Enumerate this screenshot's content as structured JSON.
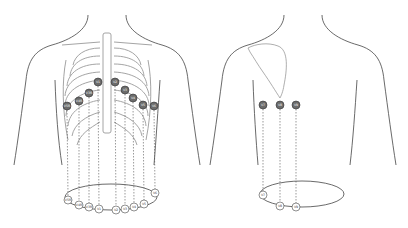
{
  "colors": {
    "outline": "#444444",
    "rib": "#9a9a9a",
    "electrode_fill": "#6b6b6b",
    "electrode_stroke": "#333333",
    "ring_electrode_fill": "#ffffff",
    "leader_line": "#555555"
  },
  "front_view": {
    "name": "front",
    "electrodes": [
      {
        "id": "V5R",
        "label": "V5R",
        "x": 67,
        "y": 106,
        "ring_x": 68,
        "ring_y": 200
      },
      {
        "id": "V4R",
        "label": "V4R",
        "x": 79,
        "y": 101,
        "ring_x": 79,
        "ring_y": 205
      },
      {
        "id": "V3R",
        "label": "V3R",
        "x": 89,
        "y": 93,
        "ring_x": 89,
        "ring_y": 207
      },
      {
        "id": "V1",
        "label": "V1",
        "x": 98,
        "y": 82,
        "ring_x": 99,
        "ring_y": 209
      },
      {
        "id": "V2",
        "label": "V2",
        "x": 115,
        "y": 82,
        "ring_x": 116,
        "ring_y": 210
      },
      {
        "id": "V3",
        "label": "V3",
        "x": 125,
        "y": 90,
        "ring_x": 125,
        "ring_y": 209
      },
      {
        "id": "V4",
        "label": "V4",
        "x": 133,
        "y": 98,
        "ring_x": 134,
        "ring_y": 207
      },
      {
        "id": "V5",
        "label": "V5",
        "x": 143,
        "y": 105,
        "ring_x": 144,
        "ring_y": 204
      },
      {
        "id": "V6",
        "label": "V6",
        "x": 154,
        "y": 106,
        "ring_x": 155,
        "ring_y": 193
      }
    ],
    "ring": {
      "cx": 111,
      "cy": 197,
      "rx": 46,
      "ry": 13
    }
  },
  "back_view": {
    "name": "back",
    "electrodes": [
      {
        "id": "V7",
        "label": "V7",
        "x": 263,
        "y": 105,
        "ring_x": 263,
        "ring_y": 195
      },
      {
        "id": "V8",
        "label": "V8",
        "x": 280,
        "y": 105,
        "ring_x": 280,
        "ring_y": 206
      },
      {
        "id": "V9",
        "label": "V9",
        "x": 296,
        "y": 105,
        "ring_x": 296,
        "ring_y": 207
      }
    ],
    "ring": {
      "cx": 302,
      "cy": 194,
      "rx": 42,
      "ry": 13
    }
  }
}
